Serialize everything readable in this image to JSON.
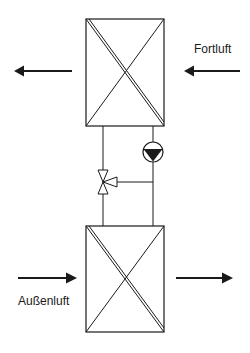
{
  "diagram": {
    "title": "",
    "labels": {
      "exhaust_air": "Fortluft",
      "outside_air": "Außenluft"
    },
    "components": [
      {
        "id": "upper-heat-exchanger",
        "type": "cross-flow-heat-exchanger"
      },
      {
        "id": "lower-heat-exchanger",
        "type": "cross-flow-heat-exchanger"
      },
      {
        "id": "circulation-pump",
        "type": "pump"
      },
      {
        "id": "three-way-valve",
        "type": "three-way-valve"
      }
    ],
    "flows": [
      {
        "id": "upper-left-arrow",
        "direction": "left"
      },
      {
        "id": "exhaust-air-arrow",
        "direction": "left",
        "label": "Fortluft"
      },
      {
        "id": "outside-air-arrow",
        "direction": "right",
        "label": "Außenluft"
      },
      {
        "id": "lower-right-arrow",
        "direction": "right"
      }
    ],
    "colors": {
      "line": "#1a1a1a",
      "background": "#ffffff"
    }
  }
}
